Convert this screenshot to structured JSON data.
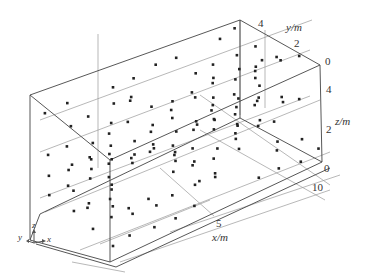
{
  "chart_data": {
    "type": "scatter3d",
    "title": "",
    "axes": {
      "x": {
        "label": "x/m",
        "ticks": [
          "5",
          "10"
        ],
        "range": [
          0,
          10
        ]
      },
      "y": {
        "label": "y/m",
        "ticks": [
          "4",
          "2",
          "0"
        ],
        "range": [
          0,
          5
        ]
      },
      "z": {
        "label": "z/m",
        "ticks": [
          "0",
          "2",
          "4"
        ],
        "range": [
          0,
          5
        ]
      }
    },
    "grid": true,
    "legend": null,
    "marker": {
      "shape": "square",
      "color": "#222222",
      "size": 3
    },
    "note": "Approximately 150 points arranged in a roughly regular grid filling a 10×5×5 m box",
    "orientation_triad": {
      "labels": [
        "y",
        "z",
        "x"
      ]
    }
  },
  "labels": {
    "xlabel": "x/m",
    "ylabel": "y/m",
    "zlabel": "z/m",
    "x_tick_5": "5",
    "x_tick_10": "10",
    "y_tick_4": "4",
    "y_tick_2": "2",
    "y_tick_0": "0",
    "z_tick_0": "0",
    "z_tick_2": "2",
    "z_tick_4": "4",
    "triad_x": "x",
    "triad_y": "y",
    "triad_z": "z"
  },
  "colors": {
    "box": "#555555",
    "grid": "#999999",
    "point": "#222222"
  }
}
